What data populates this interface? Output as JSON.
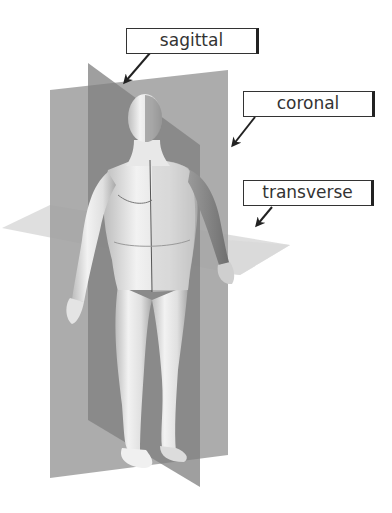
{
  "diagram": {
    "colors": {
      "background": "#ffffff",
      "coronal_plane": "#9c9c9c",
      "sagittal_plane": "#7e7e7e",
      "transverse_plane": "#d9d9d9",
      "figure_skin": "#e6e6e6",
      "figure_shadow": "#8a8a8a",
      "label_border": "#333333",
      "arrow": "#222222"
    },
    "labels": [
      {
        "id": "sagittal",
        "text": "sagittal"
      },
      {
        "id": "coronal",
        "text": "coronal"
      },
      {
        "id": "transverse",
        "text": "transverse"
      }
    ],
    "figure": {
      "description": "standing human male figure"
    }
  }
}
